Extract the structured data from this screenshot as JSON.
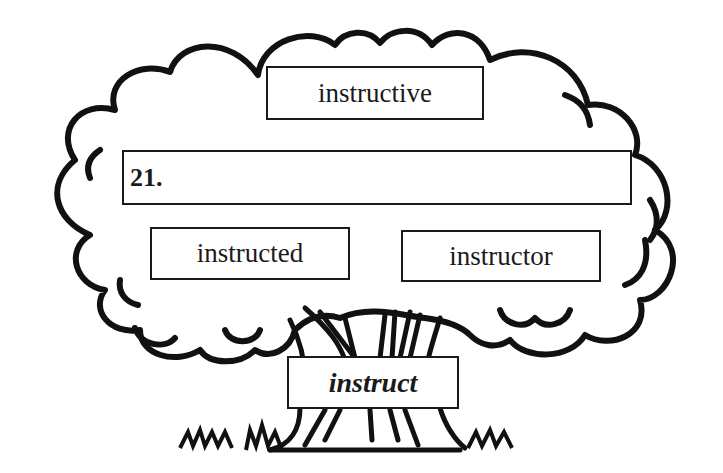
{
  "diagram": {
    "type": "word-family-tree",
    "root": {
      "label": "instruct",
      "style": "bold-italic"
    },
    "branches": [
      {
        "id": "top",
        "label": "instructive"
      },
      {
        "id": "blank",
        "label": "21.",
        "is_answer_blank": true
      },
      {
        "id": "left",
        "label": "instructed"
      },
      {
        "id": "right",
        "label": "instructor"
      }
    ],
    "colors": {
      "ink": "#1a1a1a",
      "background": "#ffffff"
    }
  }
}
